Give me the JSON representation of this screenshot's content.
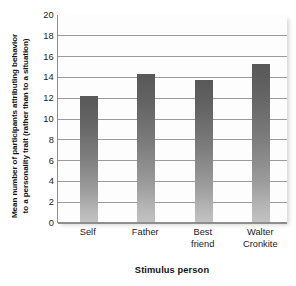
{
  "chart_data": {
    "type": "bar",
    "title": "",
    "categories": [
      "Self",
      "Father",
      "Best friend",
      "Walter Cronkite"
    ],
    "category_lines": [
      [
        "Self"
      ],
      [
        "Father"
      ],
      [
        "Best",
        "friend"
      ],
      [
        "Walter",
        "Cronkite"
      ]
    ],
    "values": [
      12.1,
      14.2,
      13.7,
      15.2
    ],
    "xlabel": "Stimulus person",
    "ylabel": "Mean number of participants attributing behavior to a personality trait (rather than to a situation)",
    "ylabel_lines": [
      "Mean number of participants attributing behavior",
      "to a personality trait (rather than to a situation)"
    ],
    "ylim": [
      0,
      20
    ],
    "yticks": [
      0,
      2,
      4,
      6,
      8,
      10,
      12,
      14,
      16,
      18,
      20
    ],
    "ytick_labels": [
      "0",
      "2",
      "4",
      "6",
      "8",
      "10",
      "12",
      "14",
      "16",
      "18",
      "20"
    ],
    "grid": true,
    "grid_axis": "y",
    "legend": "none",
    "bar_color_top": "#585858",
    "bar_color_bottom": "#c2c2c2",
    "gridline_color": "#9a9a9a",
    "axis_color": "#8e8e8e",
    "plot_background": "#fdfdfd"
  }
}
